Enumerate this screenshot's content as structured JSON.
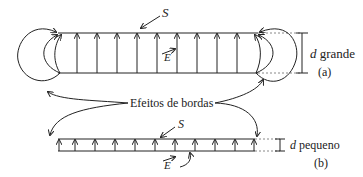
{
  "figure": {
    "panel_a": {
      "surface_label": "S",
      "field_label": "E",
      "distance_var": "d",
      "distance_desc": "grande",
      "tag": "(a)"
    },
    "panel_b": {
      "surface_label": "S",
      "field_label": "E",
      "distance_var": "d",
      "distance_desc": "pequeno",
      "tag": "(b)"
    },
    "edge_effects_label": "Efeitos de bordas",
    "colors": {
      "line": "#222222",
      "dotted": "#888888"
    }
  }
}
